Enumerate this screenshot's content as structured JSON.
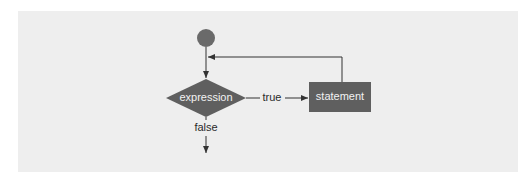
{
  "diagram": {
    "type": "flowchart",
    "colors": {
      "panel_background": "#eeeeee",
      "node_fill": "#5f5f5f",
      "start_fill": "#6a6a6a",
      "line": "#333333",
      "node_text": "#f2f2f2",
      "edge_text": "#2a2a2a"
    },
    "nodes": {
      "start": {
        "shape": "circle",
        "label": ""
      },
      "condition": {
        "shape": "diamond",
        "label": "expression"
      },
      "body": {
        "shape": "rectangle",
        "label": "statement"
      }
    },
    "edges": {
      "true_label": "true",
      "false_label": "false"
    }
  }
}
